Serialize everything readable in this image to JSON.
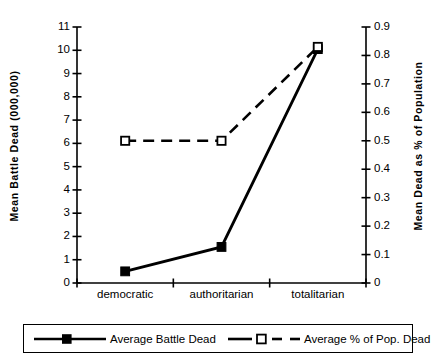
{
  "chart_data": {
    "type": "line",
    "title": "",
    "categories": [
      "democratic",
      "authoritarian",
      "totalitarian"
    ],
    "xlabel": "",
    "series": [
      {
        "name": "Average Battle Dead",
        "axis": "left",
        "line_style": "solid",
        "marker": "filled-square",
        "color": "#000000",
        "values": [
          0.5,
          1.55,
          10.05
        ]
      },
      {
        "name": "Average % of Pop. Dead",
        "axis": "right",
        "line_style": "dashed",
        "marker": "open-square",
        "color": "#000000",
        "values": [
          0.5,
          0.5,
          0.83
        ]
      }
    ],
    "left_axis": {
      "label": "Mean Battle Dead (000,000)",
      "ylim": [
        0,
        11
      ],
      "tick_step": 1,
      "ticks": [
        "0",
        "1",
        "2",
        "3",
        "4",
        "5",
        "6",
        "7",
        "8",
        "9",
        "10",
        "11"
      ]
    },
    "right_axis": {
      "label": "Mean Dead as % of Population",
      "ylim": [
        0,
        0.9
      ],
      "tick_step": 0.1,
      "ticks": [
        "0",
        "0.1",
        "0.2",
        "0.3",
        "0.4",
        "0.5",
        "0.6",
        "0.7",
        "0.8",
        "0.9"
      ]
    },
    "grid": false,
    "legend_position": "bottom",
    "legend": [
      {
        "label": "Average Battle Dead",
        "marker": "filled-square",
        "line_style": "solid"
      },
      {
        "label": "Average % of Pop. Dead",
        "marker": "open-square",
        "line_style": "dashed"
      }
    ]
  }
}
